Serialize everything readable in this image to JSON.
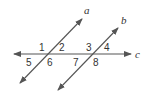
{
  "diagram": {
    "lines": [
      {
        "id": "a",
        "label": "a",
        "x1": 20,
        "y1": 83,
        "x2": 82,
        "y2": 19,
        "arrows": "both"
      },
      {
        "id": "b",
        "label": "b",
        "x1": 58,
        "y1": 90,
        "x2": 118,
        "y2": 28,
        "arrows": "both"
      },
      {
        "id": "c",
        "label": "c",
        "x1": 14,
        "y1": 54,
        "x2": 131,
        "y2": 54,
        "arrows": "both"
      }
    ],
    "line_labels": {
      "a": {
        "text": "a",
        "x": 84,
        "y": 14
      },
      "b": {
        "text": "b",
        "x": 121,
        "y": 24
      },
      "c": {
        "text": "c",
        "x": 135,
        "y": 58
      }
    },
    "angles": [
      {
        "text": "1",
        "x": 39,
        "y": 51
      },
      {
        "text": "2",
        "x": 59,
        "y": 51
      },
      {
        "text": "3",
        "x": 86,
        "y": 51
      },
      {
        "text": "4",
        "x": 104,
        "y": 51
      },
      {
        "text": "5",
        "x": 26,
        "y": 66
      },
      {
        "text": "6",
        "x": 47,
        "y": 66
      },
      {
        "text": "7",
        "x": 73,
        "y": 66
      },
      {
        "text": "8",
        "x": 93,
        "y": 66
      }
    ],
    "colors": {
      "line": "#555555",
      "text": "#333333"
    }
  }
}
